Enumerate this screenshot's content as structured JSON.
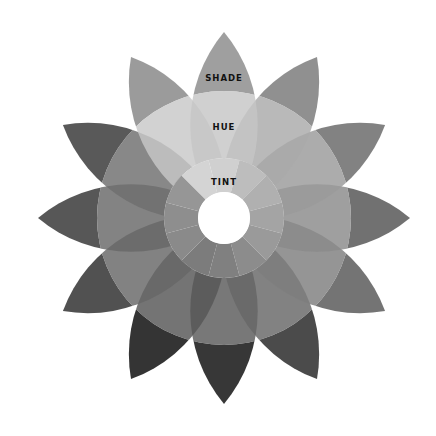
{
  "diagram": {
    "title": "",
    "labels": {
      "shade": "SHADE",
      "hue": "HUE",
      "tint": "TINT"
    },
    "petal_count": 12,
    "petals": [
      {
        "position": "top",
        "shade": "#8e8e8e",
        "hue": "#c6c6c6",
        "tint": "#d0d0d0"
      },
      {
        "position": "upper-right-1",
        "shade": "#7c7c7c",
        "hue": "#aaaaaa",
        "tint": "#bdbdbd"
      },
      {
        "position": "upper-right-2",
        "shade": "#6c6c6c",
        "hue": "#9a9a9a",
        "tint": "#b0b0b0"
      },
      {
        "position": "right",
        "shade": "#585858",
        "hue": "#8a8a8a",
        "tint": "#a4a4a4"
      },
      {
        "position": "lower-right-1",
        "shade": "#5c5c5c",
        "hue": "#7e7e7e",
        "tint": "#9a9a9a"
      },
      {
        "position": "lower-right-2",
        "shade": "#2c2c2c",
        "hue": "#666666",
        "tint": "#8c8c8c"
      },
      {
        "position": "bottom",
        "shade": "#141414",
        "hue": "#5a5a5a",
        "tint": "#808080"
      },
      {
        "position": "lower-left-2",
        "shade": "#111111",
        "hue": "#565656",
        "tint": "#7c7c7c"
      },
      {
        "position": "lower-left-1",
        "shade": "#333333",
        "hue": "#666666",
        "tint": "#8a8a8a"
      },
      {
        "position": "left",
        "shade": "#3a3a3a",
        "hue": "#686868",
        "tint": "#8e8e8e"
      },
      {
        "position": "upper-left-2",
        "shade": "#3c3c3c",
        "hue": "#6e6e6e",
        "tint": "#969696"
      },
      {
        "position": "upper-left-1",
        "shade": "#8a8a8a",
        "hue": "#c8c8c8",
        "tint": "#d4d4d4"
      }
    ]
  }
}
